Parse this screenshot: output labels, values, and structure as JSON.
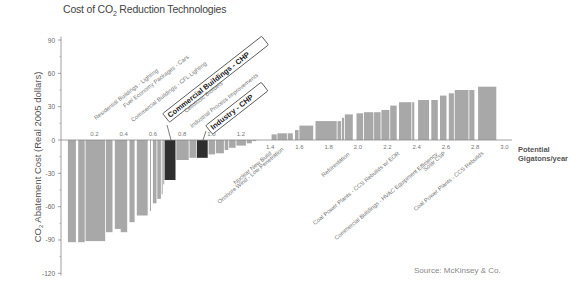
{
  "chart_data": {
    "type": "bar",
    "subtype": "marginal-abatement-cost-curve",
    "title": "Cost of CO2 Reduction Technologies",
    "title_parts": {
      "pre": "Cost of CO",
      "sub": "2",
      "post": " Reduction Technologies"
    },
    "xlabel": "Potential Gigatons/year",
    "xlabel_lines": [
      "Potential",
      "Gigatons/year"
    ],
    "ylabel": "CO2 Abatement Cost (Real 2005 dollars)",
    "ylabel_parts": {
      "pre": "CO",
      "sub": "2",
      "post": " Abatement Cost (Real 2005 dollars)"
    },
    "ylim": [
      -120,
      90
    ],
    "xlim": [
      0,
      3.0
    ],
    "yticks": [
      90,
      60,
      30,
      0,
      -30,
      -60,
      -90,
      -120
    ],
    "xticks": [
      0.2,
      0.4,
      0.6,
      0.8,
      1.0,
      1.2,
      1.4,
      1.6,
      1.8,
      2.0,
      2.2,
      2.4,
      2.6,
      2.8,
      3.0
    ],
    "xtick_labels": [
      "0.2",
      "0.4",
      "0.6",
      "0.8",
      "1.0",
      "1.2",
      "1.4",
      "1.6",
      "1.8",
      "2.0",
      "2.2",
      "2.4",
      "2.6",
      "2.8",
      "3.0"
    ],
    "grid": false,
    "legend": "none",
    "source": "Source: McKinsey & Co.",
    "bars": [
      {
        "x0": 0.02,
        "x1": 0.08,
        "value": -92
      },
      {
        "x0": 0.09,
        "x1": 0.14,
        "value": -92
      },
      {
        "x0": 0.14,
        "x1": 0.28,
        "value": -91
      },
      {
        "x0": 0.28,
        "x1": 0.33,
        "value": -83
      },
      {
        "x0": 0.34,
        "x1": 0.41,
        "value": -80
      },
      {
        "x0": 0.38,
        "x1": 0.43,
        "value": -83
      },
      {
        "x0": 0.44,
        "x1": 0.48,
        "value": -74
      },
      {
        "x0": 0.49,
        "x1": 0.57,
        "value": -68
      },
      {
        "x0": 0.58,
        "x1": 0.59,
        "value": -64
      },
      {
        "x0": 0.6,
        "x1": 0.63,
        "value": -57
      },
      {
        "x0": 0.63,
        "x1": 0.66,
        "value": -53
      },
      {
        "x0": 0.66,
        "x1": 0.67,
        "value": -49
      },
      {
        "x0": 0.67,
        "x1": 0.68,
        "value": -40
      },
      {
        "x0": 0.68,
        "x1": 0.76,
        "value": -36,
        "highlight": true,
        "label": "Commercial Buildings - CHP"
      },
      {
        "x0": 0.76,
        "x1": 0.85,
        "value": -18
      },
      {
        "x0": 0.85,
        "x1": 0.9,
        "value": -16
      },
      {
        "x0": 0.9,
        "x1": 0.98,
        "value": -16,
        "highlight": true,
        "label": "Industry - CHP"
      },
      {
        "x0": 0.98,
        "x1": 1.03,
        "value": -13
      },
      {
        "x0": 1.03,
        "x1": 1.09,
        "value": -12
      },
      {
        "x0": 1.09,
        "x1": 1.12,
        "value": -9
      },
      {
        "x0": 1.12,
        "x1": 1.17,
        "value": -7
      },
      {
        "x0": 1.17,
        "x1": 1.24,
        "value": -5
      },
      {
        "x0": 1.24,
        "x1": 1.28,
        "value": -3
      },
      {
        "x0": 1.28,
        "x1": 1.31,
        "value": -1
      },
      {
        "x0": 1.41,
        "x1": 1.45,
        "value": 5
      },
      {
        "x0": 1.45,
        "x1": 1.52,
        "value": 6
      },
      {
        "x0": 1.52,
        "x1": 1.56,
        "value": 6
      },
      {
        "x0": 1.57,
        "x1": 1.6,
        "value": 9
      },
      {
        "x0": 1.6,
        "x1": 1.7,
        "value": 13
      },
      {
        "x0": 1.71,
        "x1": 1.86,
        "value": 17
      },
      {
        "x0": 1.86,
        "x1": 1.89,
        "value": 17
      },
      {
        "x0": 1.89,
        "x1": 1.91,
        "value": 20
      },
      {
        "x0": 1.91,
        "x1": 1.97,
        "value": 23
      },
      {
        "x0": 1.99,
        "x1": 2.04,
        "value": 24
      },
      {
        "x0": 2.04,
        "x1": 2.11,
        "value": 25
      },
      {
        "x0": 2.11,
        "x1": 2.16,
        "value": 25
      },
      {
        "x0": 2.16,
        "x1": 2.22,
        "value": 27
      },
      {
        "x0": 2.22,
        "x1": 2.27,
        "value": 31
      },
      {
        "x0": 2.28,
        "x1": 2.37,
        "value": 34
      },
      {
        "x0": 2.37,
        "x1": 2.39,
        "value": 34
      },
      {
        "x0": 2.41,
        "x1": 2.49,
        "value": 36
      },
      {
        "x0": 2.5,
        "x1": 2.55,
        "value": 36
      },
      {
        "x0": 2.56,
        "x1": 2.61,
        "value": 40
      },
      {
        "x0": 2.62,
        "x1": 2.66,
        "value": 42
      },
      {
        "x0": 2.66,
        "x1": 2.76,
        "value": 45
      },
      {
        "x0": 2.76,
        "x1": 2.8,
        "value": 45
      },
      {
        "x0": 2.82,
        "x1": 2.95,
        "value": 48
      }
    ],
    "annotations_above": [
      {
        "text": "Residential Buildings - Lighting",
        "x": 0.14
      },
      {
        "text": "Fuel Economy Packages - Cars",
        "x": 0.45
      },
      {
        "text": "Commercial Buildings - CFL Lighting",
        "x": 0.52
      },
      {
        "text": "Commercial Buildings - CHP",
        "x": 0.7,
        "boxed": true
      },
      {
        "text": "Cellulosic Biofuels",
        "x": 0.8
      },
      {
        "text": "Industrial Process Improvements",
        "x": 0.87
      },
      {
        "text": "Industry - CHP",
        "x": 0.96,
        "boxed": true
      }
    ],
    "annotations_below": [
      {
        "text": "Nuclear New Build",
        "x": 1.4
      },
      {
        "text": "Onshore Wind - Low Penetration",
        "x": 1.47
      },
      {
        "text": "Reforestation",
        "x": 2.07
      },
      {
        "text": "Coal Power Plants - CCS Rebuilds w/ EOR",
        "x": 2.26
      },
      {
        "text": "Commercial Buildings - HVAC Equipment Efficiency",
        "x": 2.48
      },
      {
        "text": "Solar CSP",
        "x": 2.6
      },
      {
        "text": "Coal Power Plants - CCS Rebuilds",
        "x": 2.85
      }
    ],
    "colors": {
      "bar": "#a8a8a8",
      "highlight": "#2e2e2e",
      "axis": "#888888",
      "text": "#666666"
    }
  }
}
